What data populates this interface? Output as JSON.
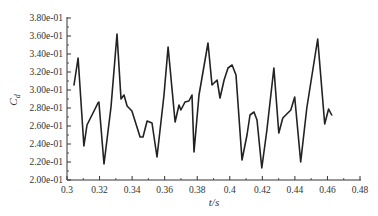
{
  "chart_data": {
    "type": "line",
    "title": "",
    "xlabel": "t/s",
    "ylabel": "C_d",
    "ylabel_main": "C",
    "ylabel_sub": "d",
    "xlim": [
      0.3,
      0.48
    ],
    "ylim": [
      0.2,
      0.38
    ],
    "grid": false,
    "legend": null,
    "x_ticks": [
      "0.3",
      "0.32",
      "0.34",
      "0.36",
      "0.38",
      "0.4",
      "0.42",
      "0.44",
      "0.46",
      "0.48"
    ],
    "y_ticks": [
      "2.00e-01",
      "2.20e-01",
      "2.40e-01",
      "2.60e-01",
      "2.80e-01",
      "3.00e-01",
      "3.20e-01",
      "3.40e-01",
      "3.60e-01",
      "3.80e-01"
    ],
    "series": [
      {
        "name": "C_d",
        "color": "#222222",
        "x": [
          0.3043,
          0.3068,
          0.3104,
          0.3123,
          0.3178,
          0.319,
          0.3196,
          0.3227,
          0.327,
          0.3307,
          0.3332,
          0.335,
          0.3369,
          0.3399,
          0.3449,
          0.3467,
          0.3492,
          0.3522,
          0.3553,
          0.3596,
          0.3621,
          0.3664,
          0.3688,
          0.37,
          0.3725,
          0.3749,
          0.3768,
          0.378,
          0.3811,
          0.3866,
          0.3891,
          0.3922,
          0.394,
          0.3965,
          0.3989,
          0.4014,
          0.4038,
          0.4075,
          0.4106,
          0.4124,
          0.4149,
          0.4167,
          0.4197,
          0.4228,
          0.4271,
          0.4301,
          0.4326,
          0.435,
          0.4375,
          0.4399,
          0.4436,
          0.4473,
          0.454,
          0.4583,
          0.4607,
          0.4626
        ],
        "y": [
          0.3056,
          0.3356,
          0.2378,
          0.2611,
          0.2811,
          0.2856,
          0.2867,
          0.2178,
          0.2811,
          0.3622,
          0.29,
          0.2944,
          0.2822,
          0.2767,
          0.2478,
          0.2478,
          0.2656,
          0.2633,
          0.2256,
          0.2944,
          0.3478,
          0.2644,
          0.2833,
          0.2778,
          0.2867,
          0.2878,
          0.2944,
          0.2311,
          0.2944,
          0.3522,
          0.3056,
          0.3111,
          0.2911,
          0.3111,
          0.3244,
          0.3278,
          0.3167,
          0.2222,
          0.25,
          0.2722,
          0.2756,
          0.2667,
          0.2133,
          0.2556,
          0.3244,
          0.2522,
          0.2689,
          0.2733,
          0.2778,
          0.2922,
          0.22,
          0.28,
          0.3567,
          0.2622,
          0.2789,
          0.2722
        ]
      }
    ]
  }
}
